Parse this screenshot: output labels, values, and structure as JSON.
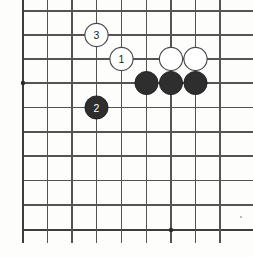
{
  "figure": {
    "kind": "go-board-diagram",
    "background_color": "#fdfdfc"
  },
  "board": {
    "line_color": "#545454",
    "edge_line_color": "#3c3c3c",
    "grid_spacing": 24.5,
    "columns": 9,
    "rows": 10,
    "x_coords": [
      23,
      47.5,
      72,
      96.5,
      121.5,
      146.5,
      171,
      195.5,
      220
    ],
    "y_coords": [
      11,
      35,
      59,
      83,
      107.5,
      132,
      156,
      180.5,
      205,
      230
    ],
    "star_points": [
      {
        "col": 0,
        "row": 3
      },
      {
        "col": 6,
        "row": 9
      }
    ],
    "star_point_color": "#2b2b2b"
  },
  "stones": [
    {
      "id": "stone-white-3",
      "color": "white",
      "label": "3",
      "col": 3,
      "row": 1
    },
    {
      "id": "stone-white-1",
      "color": "white",
      "label": "1",
      "col": 4,
      "row": 2
    },
    {
      "id": "stone-white-a",
      "color": "white",
      "label": "",
      "col": 6,
      "row": 2
    },
    {
      "id": "stone-white-b",
      "color": "white",
      "label": "",
      "col": 7,
      "row": 2
    },
    {
      "id": "stone-black-a",
      "color": "black",
      "label": "",
      "col": 5,
      "row": 3
    },
    {
      "id": "stone-black-b",
      "color": "black",
      "label": "",
      "col": 6,
      "row": 3
    },
    {
      "id": "stone-black-c",
      "color": "black",
      "label": "",
      "col": 7,
      "row": 3
    },
    {
      "id": "stone-black-2",
      "color": "black",
      "label": "2",
      "col": 3,
      "row": 4
    }
  ],
  "stone_style": {
    "radius": 11.6,
    "black_fill": "#2e2e2e",
    "black_stroke": "#1a1a1a",
    "black_label_color": "#ffffff",
    "white_fill": "#ffffff",
    "white_stroke": "#4a4a4a",
    "white_label_color": "#1c1c1c"
  },
  "artifacts": [
    {
      "name": "scan-speck",
      "x": 241,
      "y": 217,
      "r": 0.9
    }
  ]
}
